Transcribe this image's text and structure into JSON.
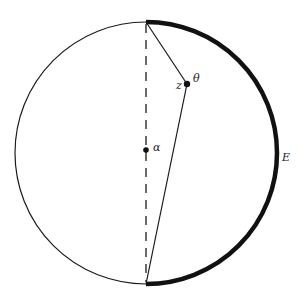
{
  "diagram": {
    "labels": {
      "z": "z",
      "theta": "θ",
      "alpha": "α",
      "E": "E"
    },
    "geometry": {
      "center": [
        146,
        153
      ],
      "radius": 131,
      "top_point": [
        146,
        22
      ],
      "bottom_point": [
        146,
        284
      ],
      "point_z": [
        187,
        84
      ],
      "point_alpha": [
        146,
        150
      ]
    },
    "colors": {
      "stroke": "#1a1a1a",
      "arc_E": "#111111"
    }
  }
}
